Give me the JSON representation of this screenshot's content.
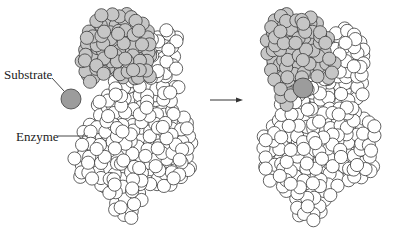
{
  "labels": {
    "substrate": "Substrate",
    "enzyme": "Enzyme"
  },
  "colors": {
    "background": "#ffffff",
    "atom_fill": "#ffffff",
    "atom_stroke": "#3a3a3a",
    "cap_fill": "#c6c6c6",
    "substrate_fill": "#9c9c9c",
    "line": "#333333"
  },
  "atom_radius": 6.6,
  "panels": [
    {
      "name": "before",
      "offset_x": 0,
      "cap_region": [
        [
          88,
          22
        ],
        [
          100,
          12
        ],
        [
          120,
          10
        ],
        [
          140,
          18
        ],
        [
          150,
          30
        ],
        [
          155,
          55
        ],
        [
          150,
          78
        ],
        [
          125,
          80
        ],
        [
          112,
          72
        ],
        [
          100,
          80
        ],
        [
          88,
          84
        ],
        [
          82,
          72
        ],
        [
          80,
          50
        ]
      ],
      "white_top_region": [
        [
          150,
          30
        ],
        [
          165,
          28
        ],
        [
          180,
          40
        ],
        [
          182,
          60
        ],
        [
          178,
          80
        ],
        [
          150,
          78
        ]
      ],
      "body_region": [
        [
          112,
          72
        ],
        [
          125,
          80
        ],
        [
          150,
          78
        ],
        [
          178,
          80
        ],
        [
          180,
          95
        ],
        [
          176,
          108
        ],
        [
          195,
          120
        ],
        [
          196,
          155
        ],
        [
          190,
          178
        ],
        [
          170,
          185
        ],
        [
          150,
          190
        ],
        [
          140,
          215
        ],
        [
          130,
          222
        ],
        [
          118,
          220
        ],
        [
          112,
          200
        ],
        [
          100,
          185
        ],
        [
          80,
          180
        ],
        [
          74,
          160
        ],
        [
          78,
          140
        ],
        [
          92,
          118
        ],
        [
          92,
          100
        ],
        [
          110,
          95
        ]
      ],
      "substrate": {
        "cx": 71,
        "cy": 99,
        "r": 10
      },
      "substrate_leader": {
        "x1": 52,
        "y1": 78,
        "x2": 64,
        "y2": 91
      },
      "enzyme_leader": {
        "x1": 58,
        "y1": 136,
        "x2": 88,
        "y2": 136
      }
    },
    {
      "name": "after",
      "offset_x": 200,
      "cap_region": [
        [
          268,
          24
        ],
        [
          280,
          14
        ],
        [
          300,
          12
        ],
        [
          320,
          20
        ],
        [
          330,
          32
        ],
        [
          336,
          55
        ],
        [
          333,
          78
        ],
        [
          305,
          78
        ],
        [
          300,
          90
        ],
        [
          290,
          106
        ],
        [
          278,
          102
        ],
        [
          272,
          80
        ],
        [
          266,
          50
        ]
      ],
      "white_top_region": [
        [
          330,
          32
        ],
        [
          345,
          26
        ],
        [
          362,
          38
        ],
        [
          366,
          60
        ],
        [
          360,
          82
        ],
        [
          333,
          78
        ]
      ],
      "body_region": [
        [
          305,
          78
        ],
        [
          333,
          78
        ],
        [
          362,
          82
        ],
        [
          364,
          100
        ],
        [
          358,
          112
        ],
        [
          378,
          124
        ],
        [
          378,
          155
        ],
        [
          372,
          178
        ],
        [
          352,
          186
        ],
        [
          332,
          192
        ],
        [
          322,
          215
        ],
        [
          312,
          222
        ],
        [
          300,
          220
        ],
        [
          294,
          200
        ],
        [
          282,
          186
        ],
        [
          262,
          180
        ],
        [
          256,
          160
        ],
        [
          260,
          140
        ],
        [
          276,
          118
        ],
        [
          278,
          102
        ],
        [
          290,
          106
        ],
        [
          300,
          90
        ]
      ],
      "substrate": {
        "cx": 303,
        "cy": 88,
        "r": 10
      }
    }
  ],
  "arrow": {
    "x1": 210,
    "y1": 100,
    "x2": 243,
    "y2": 100
  },
  "label_positions": {
    "substrate": {
      "x": 4,
      "y": 68
    },
    "enzyme": {
      "x": 16,
      "y": 130
    }
  }
}
